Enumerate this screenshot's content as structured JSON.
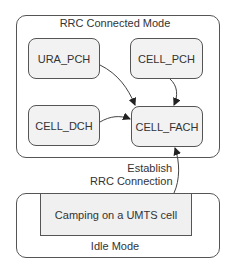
{
  "diagram": {
    "connected_mode": {
      "title": "RRC Connected Mode",
      "states": {
        "ura_pch": "URA_PCH",
        "cell_pch": "CELL_PCH",
        "cell_dch": "CELL_DCH",
        "cell_fach": "CELL_FACH"
      }
    },
    "idle_mode": {
      "title": "Idle Mode",
      "inner_state": "Camping on a UMTS cell"
    },
    "transitions": {
      "establish_line1": "Establish",
      "establish_line2": "RRC Connection"
    },
    "edges": [
      {
        "from": "URA_PCH",
        "to": "CELL_FACH"
      },
      {
        "from": "CELL_PCH",
        "to": "CELL_FACH"
      },
      {
        "from": "CELL_DCH",
        "to": "CELL_FACH"
      },
      {
        "from": "Camping on a UMTS cell",
        "to": "CELL_FACH",
        "label": "Establish RRC Connection"
      }
    ],
    "colors": {
      "stroke": "#555555",
      "state_fill": "#f2f2f2",
      "text": "#333333"
    }
  }
}
